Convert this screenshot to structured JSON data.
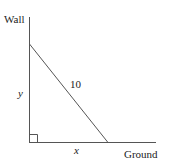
{
  "labels": {
    "wall": "Wall",
    "ground": "Ground",
    "hypotenuse": "10",
    "vertical": "y",
    "horizontal": "x"
  },
  "colors": {
    "line": "#444444",
    "text": "#222222"
  }
}
